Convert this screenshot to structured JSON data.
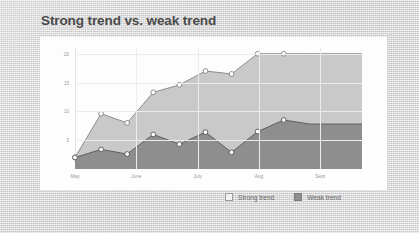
{
  "slide": {
    "title": "Strong trend vs. weak trend"
  },
  "legend": {
    "items": [
      {
        "label": "Strong trend",
        "swatch": "light-square-marker",
        "color": "#c9c9c9"
      },
      {
        "label": "Weak trend",
        "swatch": "dark-square-marker",
        "color": "#8e8e8e"
      }
    ]
  },
  "chart_data": {
    "type": "area",
    "title": "Strong trend vs. weak trend",
    "xlabel": "",
    "ylabel": "",
    "ylim": [
      0,
      21
    ],
    "yticks": [
      5,
      10,
      15,
      20
    ],
    "ytick_labels": [
      "5",
      "10",
      "15",
      "20"
    ],
    "grid": true,
    "stacked": false,
    "legend_position": "bottom-right",
    "x": [
      0,
      1,
      2,
      3,
      4,
      5,
      6,
      7,
      8,
      9,
      10,
      11
    ],
    "categories": [
      "May",
      "",
      "June",
      "",
      "July",
      "",
      "Aug",
      "",
      "Sept",
      "",
      "",
      ""
    ],
    "xtick_labels": [
      "May",
      "June",
      "July",
      "Aug",
      "Sept"
    ],
    "xtick_positions": [
      0,
      2.35,
      4.7,
      7.05,
      9.4
    ],
    "series": [
      {
        "name": "Strong trend",
        "color": "#c9c9c9",
        "line_color": "#8c8c8c",
        "marker": "circle",
        "values": [
          2.0,
          9.6,
          8.0,
          13.3,
          14.6,
          17.0,
          16.5,
          20.0,
          20.0,
          20.0,
          20.0,
          20.0
        ]
      },
      {
        "name": "Weak trend",
        "color": "#8e8e8e",
        "line_color": "#5f5f5f",
        "marker": "circle",
        "values": [
          2.0,
          3.4,
          2.6,
          6.0,
          4.3,
          6.4,
          2.9,
          6.5,
          8.5,
          7.8,
          7.8,
          7.8
        ]
      }
    ],
    "marker_count_visible": 9
  }
}
